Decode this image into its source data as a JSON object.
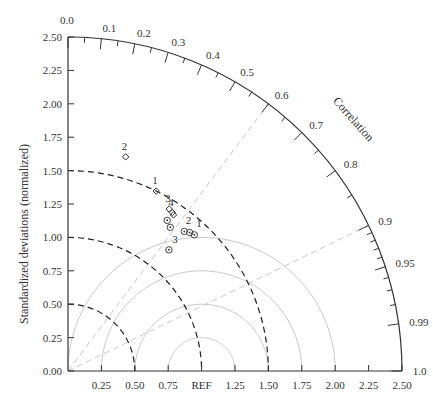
{
  "chart_data": {
    "type": "taylor",
    "title": "",
    "ylabel": "Standardized deviations (normalized)",
    "arc_label": "Correlation",
    "xlabel": "",
    "std_range": [
      0,
      2.5
    ],
    "y_ticks": [
      "0.00",
      "0.25",
      "0.50",
      "0.75",
      "1.00",
      "1.25",
      "1.50",
      "1.75",
      "2.00",
      "2.25",
      "2.50"
    ],
    "x_ticks": [
      "0.25",
      "0.50",
      "0.75",
      "REF",
      "1.25",
      "1.50",
      "1.75",
      "2.00",
      "2.25",
      "2.50"
    ],
    "correlation_ticks": [
      "0.0",
      "0.1",
      "0.2",
      "0.3",
      "0.4",
      "0.5",
      "0.6",
      "0.7",
      "0.8",
      "0.9",
      "0.95",
      "0.99",
      "1.0"
    ],
    "std_dashed_arcs": [
      0.5,
      1.0,
      1.5
    ],
    "rms_arcs": [
      0.25,
      0.5,
      0.75,
      1.0
    ],
    "correlation_guides": [
      0.6,
      0.9
    ],
    "reference_std": 1.0,
    "series": [
      {
        "name": "diamond",
        "marker": "diamond",
        "points": [
          {
            "label": "2",
            "std": 1.66,
            "corr": 0.26
          },
          {
            "label": "1",
            "std": 1.5,
            "corr": 0.44
          },
          {
            "label": "3",
            "std": 1.43,
            "corr": 0.53
          },
          {
            "label": "4",
            "std": 1.42,
            "corr": 0.55
          },
          {
            "label": "",
            "std": 1.41,
            "corr": 0.56
          }
        ]
      },
      {
        "name": "circle",
        "marker": "circle",
        "points": [
          {
            "label": "",
            "std": 1.35,
            "corr": 0.55
          },
          {
            "label": "",
            "std": 1.32,
            "corr": 0.58
          },
          {
            "label": "3",
            "std": 1.36,
            "corr": 0.64
          },
          {
            "label": "2",
            "std": 1.38,
            "corr": 0.66
          },
          {
            "label": "1",
            "std": 1.39,
            "corr": 0.68
          },
          {
            "label": "",
            "std": 1.18,
            "corr": 0.64
          }
        ]
      }
    ]
  }
}
